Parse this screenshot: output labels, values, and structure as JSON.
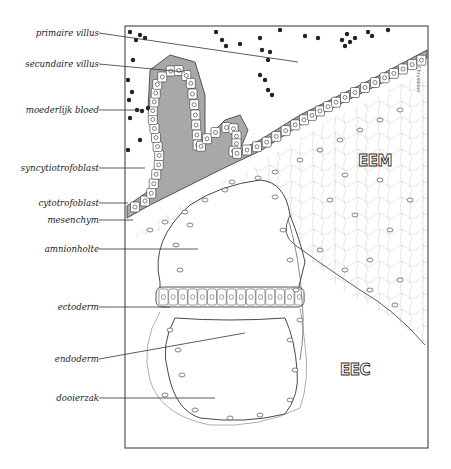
{
  "figure": {
    "labels": [
      {
        "id": "primaire-villus",
        "text": "primaire villus"
      },
      {
        "id": "secundaire-villus",
        "text": "secundaire villus"
      },
      {
        "id": "moederlijk-bloed",
        "text": "moederlijk bloed"
      },
      {
        "id": "syncytiotrofoblast",
        "text": "syncytiotrofoblast"
      },
      {
        "id": "cytotrofoblast",
        "text": "cytotrofoblast"
      },
      {
        "id": "mesenchym",
        "text": "mesenchym"
      },
      {
        "id": "amnionholte",
        "text": "amnionholte"
      },
      {
        "id": "ectoderm",
        "text": "ectoderm"
      },
      {
        "id": "endoderm",
        "text": "endoderm"
      },
      {
        "id": "dooierzak",
        "text": "dooierzak"
      }
    ],
    "region_tags": {
      "eem": "EEM",
      "eec": "EEC"
    },
    "signature": "Chrysolaer"
  },
  "colors": {
    "ink": "#2a2a2a",
    "stroke_gray": "#555555",
    "syncytio_fill": "#9a9a9a",
    "background": "#ffffff"
  }
}
